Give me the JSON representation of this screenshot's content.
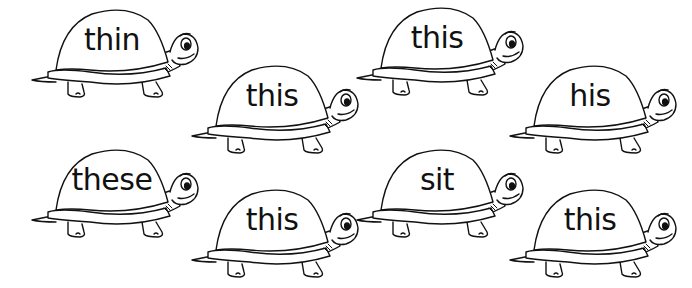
{
  "worksheet": {
    "turtles": [
      {
        "word": "thin",
        "x": 30,
        "y": 6
      },
      {
        "word": "this",
        "x": 190,
        "y": 62
      },
      {
        "word": "this",
        "x": 355,
        "y": 4
      },
      {
        "word": "his",
        "x": 508,
        "y": 62
      },
      {
        "word": "these",
        "x": 30,
        "y": 146
      },
      {
        "word": "this",
        "x": 190,
        "y": 186
      },
      {
        "word": "sit",
        "x": 355,
        "y": 146
      },
      {
        "word": "this",
        "x": 508,
        "y": 186
      }
    ]
  },
  "colors": {
    "line": "#111111",
    "background": "#ffffff"
  }
}
